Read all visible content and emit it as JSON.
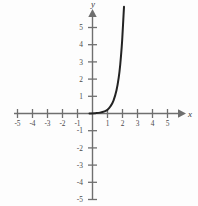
{
  "chart_data": {
    "type": "line",
    "title": "",
    "xlabel": "x",
    "ylabel": "y",
    "xlim": [
      -5.6,
      5.8
    ],
    "ylim": [
      -5.6,
      6.4
    ],
    "grid": false,
    "legend": false,
    "x_ticks": [
      -5,
      -4,
      -3,
      -2,
      -1,
      1,
      2,
      3,
      4,
      5
    ],
    "y_ticks": [
      -5,
      -4,
      -3,
      -2,
      -1,
      1,
      2,
      3,
      4,
      5
    ],
    "x_tick_labels": [
      "-5",
      "-4",
      "-3",
      "-2",
      "-1",
      "1",
      "2",
      "3",
      "4",
      "5"
    ],
    "y_tick_labels": [
      "-5",
      "-4",
      "-3",
      "-2",
      "-1",
      "1",
      "2",
      "3",
      "4",
      "5"
    ],
    "axis_color": "#6f6f6f",
    "curve_color": "#232323",
    "series": [
      {
        "name": "exponential-growth-curve",
        "x": [
          -0.2,
          0.2,
          0.5,
          0.8,
          1.0,
          1.2,
          1.4,
          1.6,
          1.75,
          1.85,
          1.95,
          2.0,
          2.05,
          2.1
        ],
        "y": [
          0.0,
          0.02,
          0.05,
          0.12,
          0.22,
          0.42,
          0.75,
          1.35,
          2.1,
          2.85,
          3.9,
          4.6,
          5.4,
          6.2
        ]
      }
    ]
  },
  "labels": {
    "x_axis": "x",
    "y_axis": "y",
    "x_neg_5": "-5",
    "x_neg_4": "-4",
    "x_neg_3": "-3",
    "x_neg_2": "-2",
    "x_neg_1": "-1",
    "x_pos_1": "1",
    "x_pos_2": "2",
    "x_pos_3": "3",
    "x_pos_4": "4",
    "x_pos_5": "5",
    "y_pos_1": "1",
    "y_pos_2": "2",
    "y_pos_3": "3",
    "y_pos_4": "4",
    "y_pos_5": "5",
    "y_neg_1": "-1",
    "y_neg_2": "-2",
    "y_neg_3": "-3",
    "y_neg_4": "-4",
    "y_neg_5": "-5"
  }
}
